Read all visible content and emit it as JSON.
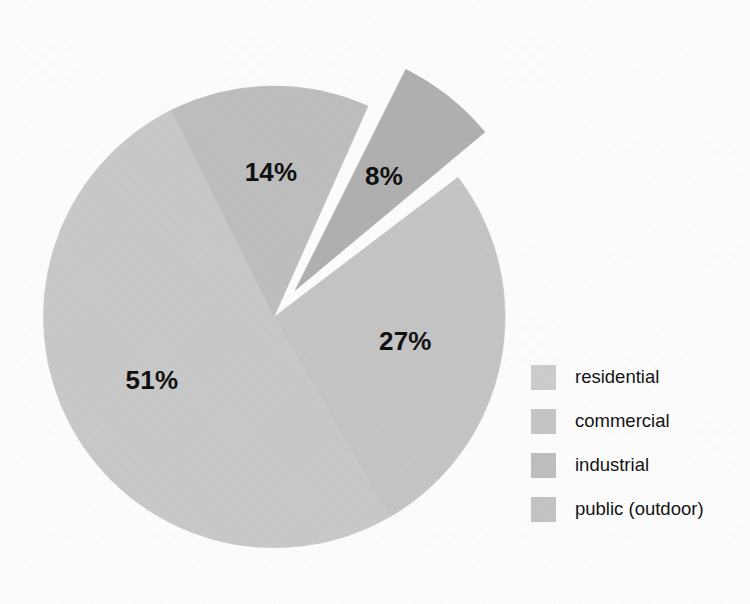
{
  "chart_data": {
    "type": "pie",
    "title": "",
    "subtitle": "",
    "xlabel": "",
    "ylabel": "",
    "grid": false,
    "legend_position": "right",
    "categories": [
      "residential",
      "commercial",
      "industrial",
      "public (outdoor)"
    ],
    "values": [
      51,
      27,
      14,
      8
    ],
    "data_labels": [
      "51%",
      "27%",
      "14%",
      "8%"
    ],
    "slices": [
      {
        "label": "residential",
        "value": 51,
        "data_label": "51%",
        "color": "#c9c9c9",
        "exploded": false
      },
      {
        "label": "commercial",
        "value": 27,
        "data_label": "27%",
        "color": "#c5c5c5",
        "exploded": false
      },
      {
        "label": "industrial",
        "value": 14,
        "data_label": "14%",
        "color": "#bebebe",
        "exploded": false
      },
      {
        "label": "public (outdoor)",
        "value": 8,
        "data_label": "8%",
        "color": "#b0b0b0",
        "exploded": true
      }
    ],
    "colors": {
      "residential": "#c9c9c9",
      "commercial": "#c5c5c5",
      "industrial": "#bebebe",
      "public_outdoor": "#b0b0b0",
      "label_text": "#111111",
      "background": "#fdfdfd"
    }
  },
  "legend": {
    "items": [
      {
        "label": "residential",
        "swatch": "#cdcdcd"
      },
      {
        "label": "commercial",
        "swatch": "#c6c6c6"
      },
      {
        "label": "industrial",
        "swatch": "#bfbfbf"
      },
      {
        "label": "public (outdoor)",
        "swatch": "#c4c4c4"
      }
    ]
  },
  "labels": {
    "slice_51": "51%",
    "slice_27": "27%",
    "slice_14": "14%",
    "slice_8": "8%"
  }
}
